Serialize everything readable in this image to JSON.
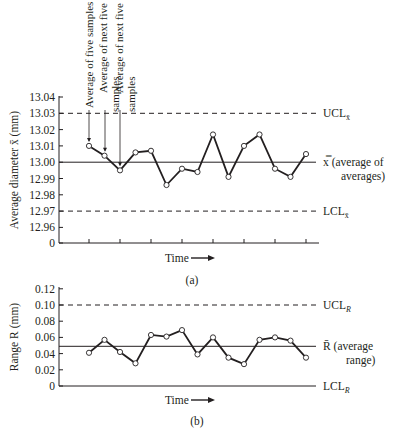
{
  "chart_data": [
    {
      "id": "a",
      "type": "line",
      "caption": "(a)",
      "title": "",
      "xlabel": "Time",
      "ylabel": "Average diameter x̄ (mm)",
      "y_ticks": [
        "13.04",
        "13.03",
        "13.02",
        "13.01",
        "13.00",
        "12.99",
        "12.98",
        "12.97",
        "12.96",
        "0"
      ],
      "ylim": [
        12.95,
        13.04
      ],
      "axis_break": true,
      "x": [
        1,
        2,
        3,
        4,
        5,
        6,
        7,
        8,
        9,
        10,
        11,
        12,
        13,
        14,
        15
      ],
      "values": [
        13.01,
        13.004,
        12.995,
        13.006,
        13.007,
        12.986,
        12.996,
        12.994,
        13.017,
        12.991,
        13.01,
        13.017,
        12.996,
        12.991,
        13.005
      ],
      "reference_lines": [
        {
          "name": "UCL",
          "label": "UCL",
          "subscript": "x̄",
          "value": 13.03,
          "style": "dashed"
        },
        {
          "name": "center",
          "label": "x̿ (average of",
          "label2": "averages)",
          "value": 13.0,
          "style": "solid"
        },
        {
          "name": "LCL",
          "label": "LCL",
          "subscript": "x̄",
          "value": 12.97,
          "style": "dashed"
        }
      ],
      "annotations": [
        {
          "text": "Average of five samples",
          "point": 1
        },
        {
          "text": "Average of next five",
          "text2": "samples",
          "point": 2
        },
        {
          "text": "Average of next five",
          "text2": "samples",
          "point": 3
        }
      ],
      "grid": false
    },
    {
      "id": "b",
      "type": "line",
      "caption": "(b)",
      "title": "",
      "xlabel": "Time",
      "ylabel": "Range R (mm)",
      "y_ticks": [
        "0.12",
        "0.10",
        "0.08",
        "0.06",
        "0.04",
        "0.02",
        "0"
      ],
      "ylim": [
        0,
        0.12
      ],
      "x": [
        1,
        2,
        3,
        4,
        5,
        6,
        7,
        8,
        9,
        10,
        11,
        12,
        13,
        14,
        15
      ],
      "values": [
        0.041,
        0.057,
        0.042,
        0.028,
        0.063,
        0.061,
        0.069,
        0.039,
        0.06,
        0.035,
        0.027,
        0.057,
        0.06,
        0.056,
        0.035
      ],
      "reference_lines": [
        {
          "name": "UCL",
          "label": "UCL",
          "subscript": "R",
          "value": 0.1,
          "style": "dashed"
        },
        {
          "name": "center",
          "label": "R̄ (average",
          "label2": "range)",
          "value": 0.049,
          "style": "solid"
        },
        {
          "name": "LCL",
          "label": "LCL",
          "subscript": "R",
          "value": 0.0,
          "style": "solid"
        }
      ],
      "grid": false
    }
  ]
}
